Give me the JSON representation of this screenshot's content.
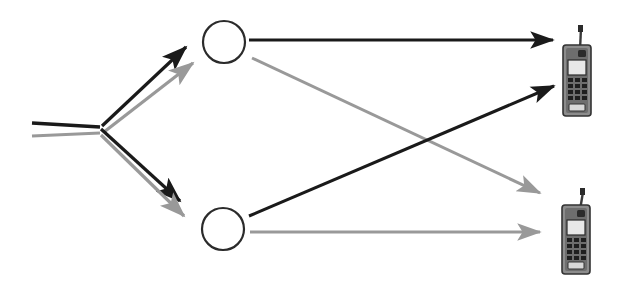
{
  "diagram": {
    "title": "Wireless two-path relay network",
    "background_color": "#ffffff",
    "canvas": {
      "width": 617,
      "height": 281
    },
    "colors": {
      "path_primary": "#1a1a1a",
      "path_secondary": "#999999",
      "node_stroke": "#2b2b2b",
      "node_fill": "#ffffff",
      "phone_body": "#4d4d4d",
      "phone_body_light": "#8c8c8c",
      "phone_screen": "#e8e8e8",
      "phone_key": "#2b2b2b",
      "phone_outline": "#333333"
    },
    "source": {
      "label": "source-feed",
      "lines": [
        {
          "label": "source-line-primary",
          "color_key": "path_primary",
          "x1": 32,
          "y1": 123,
          "x2": 100,
          "y2": 127
        },
        {
          "label": "source-line-secondary",
          "color_key": "path_secondary",
          "x1": 32,
          "y1": 136,
          "x2": 100,
          "y2": 133
        }
      ],
      "junction": {
        "x": 100,
        "y": 130
      }
    },
    "nodes": [
      {
        "label": "relay-node-top",
        "cx": 224,
        "cy": 42,
        "r": 21
      },
      {
        "label": "relay-node-bottom",
        "cx": 223,
        "cy": 229,
        "r": 21
      }
    ],
    "edges": [
      {
        "label": "source-to-relay-top-primary",
        "color_key": "path_primary",
        "width": 3.2,
        "x1": 102,
        "y1": 126,
        "x2": 190,
        "y2": 44,
        "arrow": true
      },
      {
        "label": "source-to-relay-top-secondary",
        "color_key": "path_secondary",
        "width": 3.2,
        "x1": 103,
        "y1": 132,
        "x2": 197,
        "y2": 60,
        "arrow": true
      },
      {
        "label": "source-to-relay-bottom-primary",
        "color_key": "path_primary",
        "width": 3.2,
        "x1": 101,
        "y1": 129,
        "x2": 184,
        "y2": 204,
        "arrow": true
      },
      {
        "label": "source-to-relay-bottom-secondary",
        "color_key": "path_secondary",
        "width": 3.2,
        "x1": 101,
        "y1": 135,
        "x2": 188,
        "y2": 219,
        "arrow": true
      },
      {
        "label": "relay-top-to-phone-top-primary",
        "color_key": "path_primary",
        "width": 3.0,
        "x1": 249,
        "y1": 40,
        "x2": 558,
        "y2": 40,
        "arrow": true
      },
      {
        "label": "relay-top-to-phone-bottom-secondary",
        "color_key": "path_secondary",
        "width": 3.0,
        "x1": 252,
        "y1": 58,
        "x2": 545,
        "y2": 196,
        "arrow": true
      },
      {
        "label": "relay-bottom-to-phone-top-primary",
        "color_key": "path_primary",
        "width": 3.0,
        "x1": 249,
        "y1": 216,
        "x2": 560,
        "y2": 83,
        "arrow": true
      },
      {
        "label": "relay-bottom-to-phone-bottom-secondary",
        "color_key": "path_secondary",
        "width": 3.0,
        "x1": 250,
        "y1": 232,
        "x2": 545,
        "y2": 232,
        "arrow": true
      }
    ],
    "receivers": [
      {
        "label": "mobile-phone-top",
        "x": 562,
        "y": 26,
        "width": 32,
        "height": 92
      },
      {
        "label": "mobile-phone-bottom",
        "x": 560,
        "y": 188,
        "width": 32,
        "height": 88
      }
    ]
  }
}
